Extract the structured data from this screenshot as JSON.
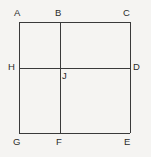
{
  "figure": {
    "kind": "geometry-diagram",
    "background_color": "#f5f4f2",
    "stroke_color": "#3a3a3a",
    "label_color": "#2b2b2b",
    "stroke_width": 1.6,
    "square": {
      "left": 19,
      "top": 22,
      "right": 130,
      "bottom": 133
    },
    "interior_lines": {
      "vertical_x": 59.5,
      "horizontal_y": 67.5
    },
    "labels": {
      "A": "A",
      "B": "B",
      "C": "C",
      "D": "D",
      "E": "E",
      "F": "F",
      "G": "G",
      "H": "H",
      "J": "J"
    },
    "points": [
      {
        "name": "A",
        "text": "A",
        "x": 19,
        "y": 22
      },
      {
        "name": "B",
        "text": "B",
        "x": 59.5,
        "y": 22
      },
      {
        "name": "C",
        "text": "C",
        "x": 130,
        "y": 22
      },
      {
        "name": "D",
        "text": "D",
        "x": 130,
        "y": 67.5
      },
      {
        "name": "E",
        "text": "E",
        "x": 130,
        "y": 133
      },
      {
        "name": "F",
        "text": "F",
        "x": 59.5,
        "y": 133
      },
      {
        "name": "G",
        "text": "G",
        "x": 19,
        "y": 133
      },
      {
        "name": "H",
        "text": "H",
        "x": 19,
        "y": 67.5
      },
      {
        "name": "J",
        "text": "J",
        "x": 59.5,
        "y": 67.5
      }
    ],
    "segments": [
      {
        "name": "top-edge",
        "from": "A",
        "to": "C"
      },
      {
        "name": "right-edge",
        "from": "C",
        "to": "E"
      },
      {
        "name": "bottom-edge",
        "from": "G",
        "to": "E"
      },
      {
        "name": "left-edge",
        "from": "A",
        "to": "G"
      },
      {
        "name": "vertical-median",
        "from": "B",
        "to": "F"
      },
      {
        "name": "horizontal-median",
        "from": "H",
        "to": "D"
      }
    ]
  }
}
